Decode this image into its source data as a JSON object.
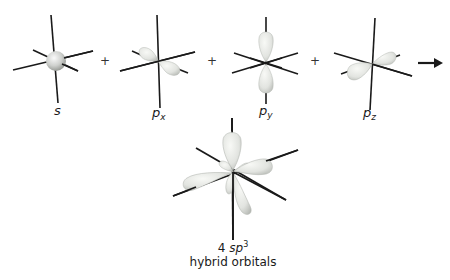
{
  "colors": {
    "axis": "#1a1a1a",
    "lobe_fill": "#e4e6e2",
    "lobe_shadow": "#b8bbb6",
    "lobe_highlight": "#f7f8f5",
    "sphere_mid": "#c9cbc8",
    "text": "#1a1a1a"
  },
  "orbitals": [
    {
      "id": "s",
      "label_main": "s",
      "label_sub": ""
    },
    {
      "id": "px",
      "label_main": "p",
      "label_sub": "x"
    },
    {
      "id": "py",
      "label_main": "p",
      "label_sub": "y"
    },
    {
      "id": "pz",
      "label_main": "p",
      "label_sub": "z"
    }
  ],
  "operators": {
    "plus": "+",
    "arrow": "→"
  },
  "result": {
    "count": "4",
    "type_main": "sp",
    "type_sup": "3",
    "caption_line2": "hybrid orbitals"
  }
}
